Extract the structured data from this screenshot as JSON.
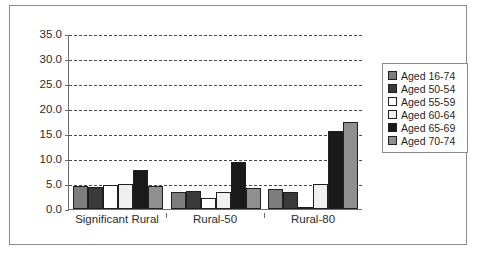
{
  "chart_data": {
    "type": "bar",
    "title": "",
    "xlabel": "",
    "ylabel": "",
    "ylim": [
      0,
      35
    ],
    "ytick_step": 5,
    "grid": true,
    "legend_position": "right",
    "categories": [
      "Significant Rural",
      "Rural-50",
      "Rural-80"
    ],
    "ytick_labels": [
      "35.0",
      "30.0",
      "25.0",
      "20.0",
      "15.0",
      "10.0",
      "5.0",
      "0.0"
    ],
    "ytick_values": [
      35,
      30,
      25,
      20,
      15,
      10,
      5,
      0
    ],
    "series": [
      {
        "name": "Aged 16-74",
        "color": "#7d7d7d",
        "values": [
          4.6,
          3.4,
          4.0
        ]
      },
      {
        "name": "Aged 50-54",
        "color": "#3a3a3a",
        "values": [
          4.5,
          3.6,
          3.5
        ]
      },
      {
        "name": "Aged 55-59",
        "color": "#ffffff",
        "values": [
          4.9,
          2.3,
          0.2
        ]
      },
      {
        "name": "Aged 60-64",
        "color": "#efefef",
        "values": [
          5.0,
          3.4,
          5.0
        ]
      },
      {
        "name": "Aged 65-69",
        "color": "#1a1a1a",
        "values": [
          7.8,
          9.5,
          15.7
        ]
      },
      {
        "name": "Aged 70-74",
        "color": "#8f8f8f",
        "values": [
          4.7,
          4.2,
          17.4
        ]
      }
    ]
  }
}
